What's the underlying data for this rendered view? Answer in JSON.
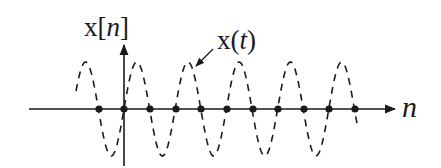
{
  "diagram": {
    "labels": {
      "vertical_axis": "x[n]",
      "vertical_axis_prefix": "x[",
      "vertical_axis_var": "n",
      "vertical_axis_suffix": "]",
      "curve": "x(t)",
      "curve_prefix": "x(",
      "curve_var": "t",
      "curve_suffix": ")",
      "horizontal_axis": "n"
    },
    "colors": {
      "ink": "#1a1a1a",
      "background": "#ffffff"
    },
    "geometry": {
      "axis_y": 109,
      "axis_x_start": 29,
      "axis_x_end": 395,
      "v_axis_x": 124,
      "v_axis_top": 45,
      "v_axis_bottom": 166,
      "wave_x_start": 76,
      "wave_x_end": 358,
      "wave_amplitude": 47,
      "wave_period": 51.2,
      "wave_phase_zero_x": 124
    },
    "samples_x": [
      99,
      124,
      150,
      176,
      201,
      227,
      253,
      278,
      304,
      329,
      355
    ],
    "sample_values": [
      0,
      0,
      0,
      0,
      0,
      0,
      0,
      0,
      0,
      0,
      0
    ]
  }
}
